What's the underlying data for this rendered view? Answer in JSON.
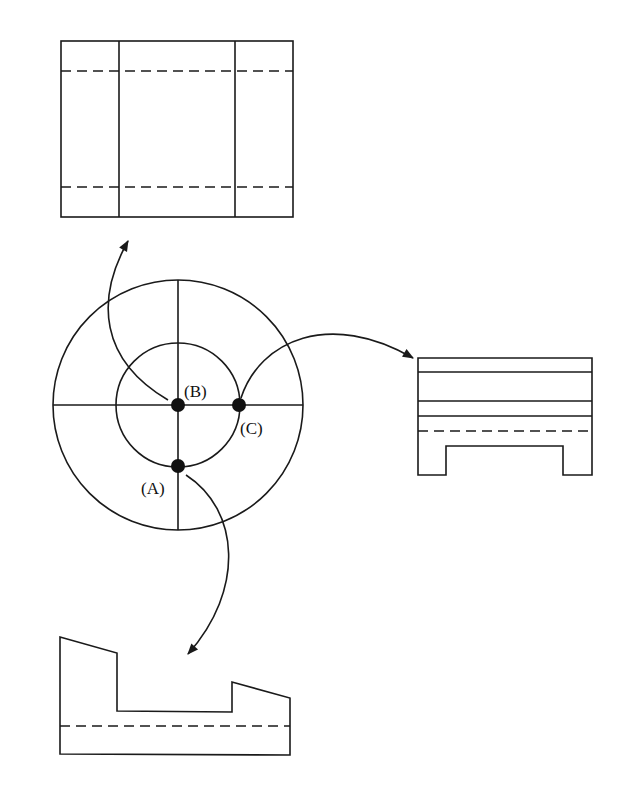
{
  "diagram": {
    "stroke_color": "#1a1a1a",
    "background": "#ffffff",
    "center_view": {
      "center": [
        178,
        405
      ],
      "outer_radius": 125,
      "inner_radius": 62,
      "points": [
        {
          "id": "B",
          "label": "(B)",
          "x": 178,
          "y": 405
        },
        {
          "id": "C",
          "label": "(C)",
          "x": 239,
          "y": 405
        },
        {
          "id": "A",
          "label": "(A)",
          "x": 178,
          "y": 466
        }
      ]
    },
    "views": [
      {
        "id": "top-view",
        "from_point": "B"
      },
      {
        "id": "right-view",
        "from_point": "C"
      },
      {
        "id": "bottom-view",
        "from_point": "A"
      }
    ]
  }
}
